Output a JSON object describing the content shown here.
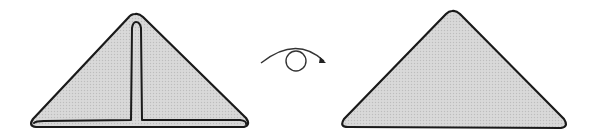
{
  "diagram": {
    "colors": {
      "fill": "#d4d4d4",
      "stroke": "#1a1a1a",
      "background": "#ffffff"
    },
    "steps": [
      {
        "id": "before",
        "shape": "triangle-with-folded-flaps"
      },
      {
        "id": "action",
        "symbol": "turn-over-icon"
      },
      {
        "id": "after",
        "shape": "plain-triangle"
      }
    ]
  }
}
